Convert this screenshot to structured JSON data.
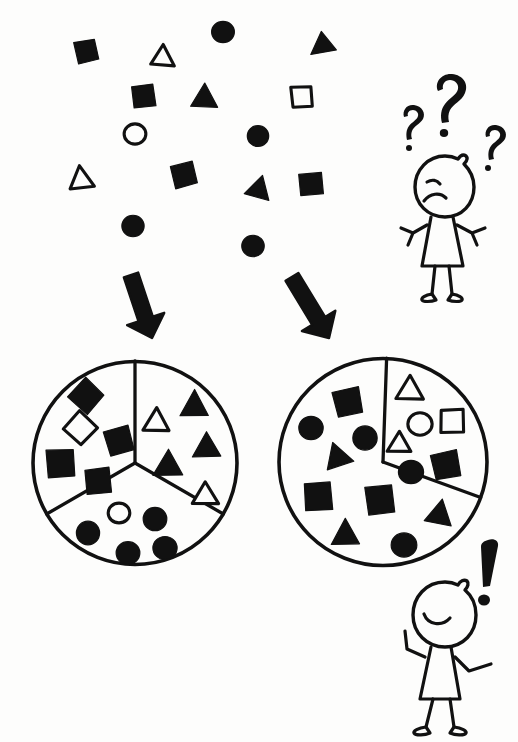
{
  "illustration": {
    "title": "Sorting scattered shapes into two different groupings",
    "style": "hand-drawn black ink sketch on white",
    "colors": {
      "ink": "#111111",
      "paper": "#fdfdfc"
    }
  },
  "scatter": {
    "label": "unsorted-shape-cloud",
    "count": 16,
    "shapes": [
      {
        "kind": "square",
        "fill": "solid",
        "x": 86,
        "y": 51,
        "size": 21,
        "rot": -12
      },
      {
        "kind": "triangle",
        "fill": "outline",
        "x": 163,
        "y": 56,
        "size": 23,
        "rot": 4
      },
      {
        "kind": "circle",
        "fill": "solid",
        "x": 223,
        "y": 32,
        "size": 23,
        "rot": 0
      },
      {
        "kind": "triangle",
        "fill": "solid",
        "x": 325,
        "y": 46,
        "size": 23,
        "rot": 112
      },
      {
        "kind": "square",
        "fill": "solid",
        "x": 144,
        "y": 96,
        "size": 22,
        "rot": -9
      },
      {
        "kind": "triangle",
        "fill": "solid",
        "x": 204,
        "y": 96,
        "size": 25,
        "rot": 2
      },
      {
        "kind": "square",
        "fill": "outline",
        "x": 302,
        "y": 97,
        "size": 20,
        "rot": -3
      },
      {
        "kind": "circle",
        "fill": "outline",
        "x": 135,
        "y": 134,
        "size": 21,
        "rot": 0
      },
      {
        "kind": "circle",
        "fill": "solid",
        "x": 258,
        "y": 136,
        "size": 22,
        "rot": 0
      },
      {
        "kind": "triangle",
        "fill": "outline",
        "x": 81,
        "y": 178,
        "size": 23,
        "rot": -8
      },
      {
        "kind": "square",
        "fill": "solid",
        "x": 184,
        "y": 175,
        "size": 23,
        "rot": -14
      },
      {
        "kind": "triangle",
        "fill": "solid",
        "x": 259,
        "y": 188,
        "size": 24,
        "rot": 16
      },
      {
        "kind": "square",
        "fill": "solid",
        "x": 311,
        "y": 184,
        "size": 22,
        "rot": -4
      },
      {
        "kind": "circle",
        "fill": "solid",
        "x": 133,
        "y": 226,
        "size": 22,
        "rot": 0
      },
      {
        "kind": "circle",
        "fill": "solid",
        "x": 253,
        "y": 246,
        "size": 23,
        "rot": 0
      }
    ]
  },
  "arrows": [
    {
      "name": "arrow-to-left-grouping",
      "from": [
        131,
        275
      ],
      "to": [
        152,
        338
      ]
    },
    {
      "name": "arrow-to-right-grouping",
      "from": [
        292,
        277
      ],
      "to": [
        329,
        338
      ]
    }
  ],
  "figures": {
    "confused": {
      "name": "confused-person",
      "mood": "confused",
      "marks": [
        "?",
        "?",
        "?"
      ],
      "mark_count": 3,
      "position": "top-right"
    },
    "pleased": {
      "name": "pleased-person",
      "mood": "pleased",
      "marks": [
        "!"
      ],
      "mark_count": 1,
      "position": "bottom-right"
    }
  },
  "groupings": [
    {
      "name": "left-grouping",
      "label": "three-way split by shape kind",
      "center": [
        135,
        463
      ],
      "radius": 102,
      "sector_count": 3,
      "sectors": [
        {
          "name": "sector-squares",
          "criterion": "squares",
          "start_deg": 270,
          "end_deg": 30,
          "contents": [
            {
              "kind": "square",
              "fill": "solid",
              "x": 86,
              "y": 396,
              "size": 26,
              "rot": 42
            },
            {
              "kind": "square",
              "fill": "outline",
              "x": 80,
              "y": 428,
              "size": 24,
              "rot": 44
            },
            {
              "kind": "square",
              "fill": "solid",
              "x": 119,
              "y": 441,
              "size": 25,
              "rot": -16
            },
            {
              "kind": "square",
              "fill": "solid",
              "x": 61,
              "y": 463,
              "size": 27,
              "rot": -3
            },
            {
              "kind": "square",
              "fill": "solid",
              "x": 98,
              "y": 481,
              "size": 25,
              "rot": -5
            }
          ]
        },
        {
          "name": "sector-triangles",
          "criterion": "triangles",
          "start_deg": 30,
          "end_deg": 150,
          "contents": [
            {
              "kind": "triangle",
              "fill": "outline",
              "x": 156,
              "y": 420,
              "size": 24,
              "rot": 0
            },
            {
              "kind": "triangle",
              "fill": "solid",
              "x": 194,
              "y": 404,
              "size": 27,
              "rot": 0
            },
            {
              "kind": "triangle",
              "fill": "solid",
              "x": 207,
              "y": 446,
              "size": 26,
              "rot": 0
            },
            {
              "kind": "triangle",
              "fill": "solid",
              "x": 168,
              "y": 464,
              "size": 27,
              "rot": 0
            },
            {
              "kind": "triangle",
              "fill": "outline",
              "x": 205,
              "y": 494,
              "size": 24,
              "rot": 0
            }
          ]
        },
        {
          "name": "sector-circles",
          "criterion": "circles",
          "start_deg": 150,
          "end_deg": 270,
          "contents": [
            {
              "kind": "circle",
              "fill": "outline",
              "x": 119,
              "y": 513,
              "size": 21,
              "rot": 0
            },
            {
              "kind": "circle",
              "fill": "solid",
              "x": 155,
              "y": 519,
              "size": 24,
              "rot": 0
            },
            {
              "kind": "circle",
              "fill": "solid",
              "x": 88,
              "y": 533,
              "size": 24,
              "rot": 0
            },
            {
              "kind": "circle",
              "fill": "solid",
              "x": 128,
              "y": 553,
              "size": 24,
              "rot": 0
            },
            {
              "kind": "circle",
              "fill": "solid",
              "x": 165,
              "y": 548,
              "size": 24,
              "rot": 0
            }
          ]
        }
      ]
    },
    {
      "name": "right-grouping",
      "label": "two-way split by fill",
      "center": [
        383,
        462
      ],
      "radius": 104,
      "sector_count": 2,
      "sectors": [
        {
          "name": "sector-outline-shapes",
          "criterion": "outlined shapes",
          "start_deg": 272,
          "end_deg": 20,
          "contents": [
            {
              "kind": "triangle",
              "fill": "outline",
              "x": 410,
              "y": 388,
              "size": 25,
              "rot": 0
            },
            {
              "kind": "circle",
              "fill": "outline",
              "x": 420,
              "y": 424,
              "size": 24,
              "rot": 0
            },
            {
              "kind": "square",
              "fill": "outline",
              "x": 452,
              "y": 421,
              "size": 22,
              "rot": 0
            },
            {
              "kind": "triangle",
              "fill": "outline",
              "x": 399,
              "y": 443,
              "size": 21,
              "rot": 0
            }
          ]
        },
        {
          "name": "sector-solid-shapes",
          "criterion": "solid shapes",
          "start_deg": 20,
          "end_deg": 272,
          "contents": [
            {
              "kind": "square",
              "fill": "solid",
              "x": 348,
              "y": 402,
              "size": 26,
              "rot": -12
            },
            {
              "kind": "circle",
              "fill": "solid",
              "x": 311,
              "y": 428,
              "size": 25,
              "rot": 0
            },
            {
              "kind": "circle",
              "fill": "solid",
              "x": 365,
              "y": 438,
              "size": 25,
              "rot": 0
            },
            {
              "kind": "triangle",
              "fill": "solid",
              "x": 337,
              "y": 456,
              "size": 26,
              "rot": -18
            },
            {
              "kind": "square",
              "fill": "solid",
              "x": 318,
              "y": 497,
              "size": 27,
              "rot": -4
            },
            {
              "kind": "triangle",
              "fill": "solid",
              "x": 346,
              "y": 533,
              "size": 26,
              "rot": 0
            },
            {
              "kind": "square",
              "fill": "solid",
              "x": 380,
              "y": 500,
              "size": 27,
              "rot": -6
            },
            {
              "kind": "circle",
              "fill": "solid",
              "x": 411,
              "y": 472,
              "size": 25,
              "rot": 0
            },
            {
              "kind": "square",
              "fill": "solid",
              "x": 446,
              "y": 465,
              "size": 26,
              "rot": -12
            },
            {
              "kind": "triangle",
              "fill": "solid",
              "x": 440,
              "y": 513,
              "size": 26,
              "rot": 12
            },
            {
              "kind": "circle",
              "fill": "solid",
              "x": 404,
              "y": 545,
              "size": 25,
              "rot": 0
            }
          ]
        }
      ]
    }
  ]
}
